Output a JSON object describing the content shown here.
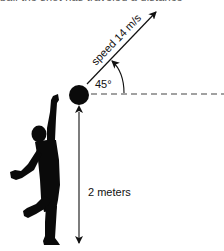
{
  "diagram": {
    "top_text_cropped": "ball the shot has traveled a distance",
    "velocity_label": "speed 14 m/s",
    "angle_label": "45°",
    "height_label": "2 meters",
    "colors": {
      "ink": "#111111",
      "dash": "#444444",
      "background": "#ffffff"
    },
    "geometry": {
      "ball_center": [
        79,
        95
      ],
      "ball_radius": 10,
      "launch_angle_deg": 45,
      "horizontal_reference": "dashed",
      "vertical_arrow_x": 79,
      "vertical_arrow_y": [
        111,
        244
      ]
    }
  }
}
